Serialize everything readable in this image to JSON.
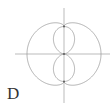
{
  "figure": {
    "label": "D",
    "colors": {
      "axis": "#aaaaaa",
      "curve": "#9a9a9a",
      "point": "#555555",
      "label": "#333333"
    },
    "center": {
      "x": 64,
      "y": 54
    },
    "axes": {
      "horizontal": {
        "x1": 15,
        "x2": 110,
        "y": 54
      },
      "vertical": {
        "x": 64,
        "y1": 8,
        "y2": 103
      }
    },
    "outer_curve": {
      "equation": "r = a + b|cos θ|^0.5",
      "a": 27.5,
      "b": 9.5,
      "p": 0.5
    },
    "inner_curve": {
      "equation": "r = c·sin²θ",
      "c": 27.5
    },
    "points": [
      {
        "x": 64,
        "y": 26.5
      },
      {
        "x": 64,
        "y": 54
      },
      {
        "x": 64,
        "y": 81.5
      }
    ]
  }
}
